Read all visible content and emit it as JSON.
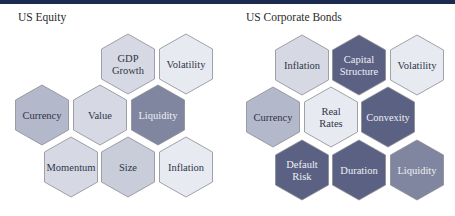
{
  "panels": [
    {
      "title": "US Equity",
      "hexagons": [
        {
          "label": [
            "GDP",
            "Growth"
          ],
          "cx": 128,
          "cy": 64,
          "shade": "light"
        },
        {
          "label": [
            "Volatility"
          ],
          "cx": 186,
          "cy": 64,
          "shade": "lightest"
        },
        {
          "label": [
            "Currency"
          ],
          "cx": 42,
          "cy": 115,
          "shade": "medium"
        },
        {
          "label": [
            "Value"
          ],
          "cx": 100,
          "cy": 115,
          "shade": "light"
        },
        {
          "label": [
            "Liquidity"
          ],
          "cx": 158,
          "cy": 115,
          "shade": "dark"
        },
        {
          "label": [
            "Momentum"
          ],
          "cx": 71,
          "cy": 167,
          "shade": "light"
        },
        {
          "label": [
            "Size"
          ],
          "cx": 128,
          "cy": 167,
          "shade": "light-medium"
        },
        {
          "label": [
            "Inflation"
          ],
          "cx": 186,
          "cy": 167,
          "shade": "lightest"
        }
      ]
    },
    {
      "title": "US Corporate Bonds",
      "hexagons": [
        {
          "label": [
            "Inflation"
          ],
          "cx": 302,
          "cy": 65,
          "shade": "light"
        },
        {
          "label": [
            "Capital",
            "Structure"
          ],
          "cx": 359,
          "cy": 65,
          "shade": "darkest"
        },
        {
          "label": [
            "Volatility"
          ],
          "cx": 417,
          "cy": 65,
          "shade": "lightest"
        },
        {
          "label": [
            "Currency"
          ],
          "cx": 273,
          "cy": 117,
          "shade": "medium"
        },
        {
          "label": [
            "Real",
            "Rates"
          ],
          "cx": 331,
          "cy": 117,
          "shade": "lightest"
        },
        {
          "label": [
            "Convexity"
          ],
          "cx": 388,
          "cy": 117,
          "shade": "darkest"
        },
        {
          "label": [
            "Default",
            "Risk"
          ],
          "cx": 302,
          "cy": 170,
          "shade": "darkest"
        },
        {
          "label": [
            "Duration"
          ],
          "cx": 359,
          "cy": 170,
          "shade": "darkest"
        },
        {
          "label": [
            "Liquidity"
          ],
          "cx": 417,
          "cy": 170,
          "shade": "dark"
        }
      ]
    }
  ],
  "shades": {
    "lightest": {
      "fill": "#e8eaf1",
      "text": "#2f3547"
    },
    "light": {
      "fill": "#d6d9e4",
      "text": "#2f3547"
    },
    "light-medium": {
      "fill": "#c9cdda",
      "text": "#2f3547"
    },
    "medium": {
      "fill": "#b3b8ca",
      "text": "#2f3547"
    },
    "dark": {
      "fill": "#80869f",
      "text": "#eef0f6"
    },
    "darkest": {
      "fill": "#5a6182",
      "text": "#eef0f6"
    }
  },
  "colors": {
    "top_bar": "#1c2a4f",
    "hex_stroke": "#8a8c94"
  }
}
